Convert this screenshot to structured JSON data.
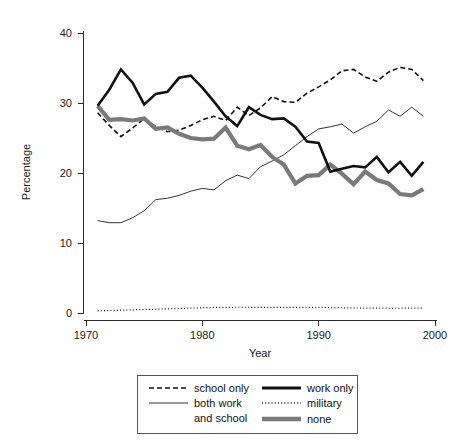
{
  "chart_data": {
    "type": "line",
    "title": "",
    "xlabel": "Year",
    "ylabel": "Percentage",
    "xlim": [
      1970,
      2000
    ],
    "ylim": [
      0,
      42
    ],
    "xticks": [
      1970,
      1980,
      1990,
      2000
    ],
    "yticks": [
      0,
      10,
      20,
      30,
      40
    ],
    "grid": false,
    "legend_position": "bottom-center",
    "x": [
      1971,
      1972,
      1973,
      1974,
      1975,
      1976,
      1977,
      1978,
      1979,
      1980,
      1981,
      1982,
      1983,
      1984,
      1985,
      1986,
      1987,
      1988,
      1989,
      1990,
      1991,
      1992,
      1993,
      1994,
      1995,
      1996,
      1997,
      1998,
      1999
    ],
    "series": [
      {
        "name": "school only",
        "style": "dashed",
        "color": "#111111",
        "width": 1.6,
        "values": [
          28.6,
          26.8,
          25.2,
          26.4,
          27.8,
          26.6,
          25.9,
          26.1,
          26.8,
          27.6,
          28.1,
          27.5,
          29.4,
          28.2,
          29.3,
          30.9,
          30.2,
          30.1,
          31.4,
          32.3,
          33.3,
          34.6,
          34.8,
          33.7,
          33.1,
          34.4,
          35.1,
          34.8,
          33.2
        ]
      },
      {
        "name": "both work and school",
        "style": "solid",
        "color": "#333333",
        "width": 1.0,
        "values": [
          13.2,
          12.9,
          12.9,
          13.6,
          14.6,
          16.2,
          16.4,
          16.8,
          17.4,
          17.8,
          17.6,
          18.9,
          19.7,
          19.2,
          20.9,
          21.7,
          22.6,
          23.9,
          25.2,
          26.3,
          26.6,
          27.0,
          25.7,
          26.6,
          27.4,
          29.0,
          28.1,
          29.4,
          28.1
        ]
      },
      {
        "name": "work only",
        "style": "solid",
        "color": "#111111",
        "width": 2.6,
        "values": [
          29.6,
          31.9,
          34.8,
          32.9,
          29.8,
          31.3,
          31.6,
          33.6,
          33.9,
          32.2,
          30.2,
          28.1,
          26.7,
          29.4,
          28.3,
          27.7,
          27.8,
          26.6,
          24.5,
          24.3,
          20.2,
          20.6,
          21.0,
          20.8,
          22.3,
          20.1,
          21.6,
          19.6,
          21.6
        ]
      },
      {
        "name": "military",
        "style": "dotted",
        "color": "#111111",
        "width": 1.2,
        "values": [
          0.3,
          0.35,
          0.4,
          0.45,
          0.5,
          0.55,
          0.6,
          0.65,
          0.7,
          0.75,
          0.8,
          0.8,
          0.82,
          0.82,
          0.8,
          0.8,
          0.8,
          0.8,
          0.82,
          0.8,
          0.78,
          0.75,
          0.72,
          0.7,
          0.7,
          0.68,
          0.68,
          0.7,
          0.7
        ]
      },
      {
        "name": "none",
        "style": "solid",
        "color": "#7a7a7a",
        "width": 4.2,
        "values": [
          29.6,
          27.6,
          27.7,
          27.5,
          27.8,
          26.3,
          26.5,
          25.6,
          25.0,
          24.8,
          24.9,
          26.5,
          23.9,
          23.4,
          24.0,
          22.3,
          21.2,
          18.5,
          19.6,
          19.7,
          21.2,
          19.9,
          18.4,
          20.2,
          19.0,
          18.5,
          17.0,
          16.8,
          17.7
        ]
      }
    ],
    "legend": [
      {
        "label": "school only",
        "style": "dashed",
        "color": "#111111",
        "width": 1.6
      },
      {
        "label": "both work",
        "style": "solid",
        "color": "#333333",
        "width": 1.0
      },
      {
        "label": "and school",
        "style": "none",
        "color": "#333333",
        "width": 0
      },
      {
        "label": "work only",
        "style": "solid",
        "color": "#111111",
        "width": 2.6
      },
      {
        "label": "military",
        "style": "dotted",
        "color": "#111111",
        "width": 1.2
      },
      {
        "label": "none",
        "style": "solid",
        "color": "#7a7a7a",
        "width": 4.2
      }
    ]
  },
  "axes": {
    "y_title": "Percentage",
    "x_title": "Year",
    "y_tick_labels": [
      "0",
      "10",
      "20",
      "30",
      "40"
    ],
    "x_tick_labels": [
      "1970",
      "1980",
      "1990",
      "2000"
    ]
  },
  "legend": {
    "school_only": "school only",
    "both_work": "both work",
    "and_school": "and school",
    "work_only": "work only",
    "military": "military",
    "none": "none"
  }
}
